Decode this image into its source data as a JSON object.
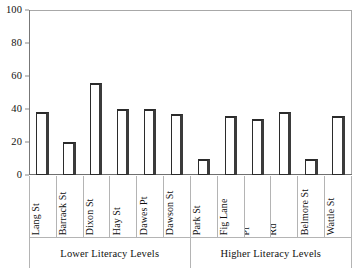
{
  "chart_data": {
    "type": "bar",
    "title": "",
    "xlabel": "",
    "ylabel": "",
    "ylim": [
      0,
      100
    ],
    "yticks": [
      0,
      20,
      40,
      60,
      80,
      100
    ],
    "grid": false,
    "legend": "none",
    "categories": [
      "Lang St",
      "Barrack St",
      "Dixon St",
      "Hay St",
      "Dawes Pt",
      "Dawson St",
      "Park St",
      "Fig Lane",
      "Wentworth Pl",
      "Wynyard Rd",
      "Belmore St",
      "Wattle St"
    ],
    "category_lines": [
      [
        "Lang St"
      ],
      [
        "Barrack St"
      ],
      [
        "Dixon St"
      ],
      [
        "Hay St"
      ],
      [
        "Dawes Pt"
      ],
      [
        "Dawson St"
      ],
      [
        "Park St"
      ],
      [
        "Fig Lane"
      ],
      [
        "Wentworth",
        "Pl"
      ],
      [
        "Wynyard",
        "Rd"
      ],
      [
        "Belmore St"
      ],
      [
        "Wattle St"
      ]
    ],
    "values": [
      38,
      20,
      56,
      40,
      40,
      37,
      10,
      36,
      34,
      38,
      10,
      36
    ],
    "groups": [
      {
        "label": "Lower Literacy Levels",
        "start": 0,
        "count": 6
      },
      {
        "label": "Higher Literacy Levels",
        "start": 6,
        "count": 6
      }
    ],
    "colors": {
      "bar_fill": "#ffffff",
      "bar_edge": "#2b2b2b",
      "bar_shadow": "#3b3b3b",
      "axis": "#8a8a8a",
      "frame": "#a8a8a8",
      "text": "#111111"
    }
  }
}
